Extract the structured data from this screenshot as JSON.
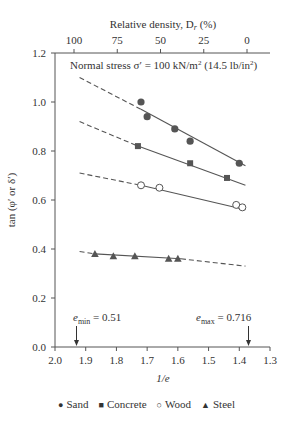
{
  "chart_data": {
    "type": "scatter",
    "title": "",
    "annotation": "Normal stress σ′ = 100 kN/m² (14.5 lb/in²)",
    "xlabel": "1/e",
    "ylabel": "tan (φ′ or δ′)",
    "top_xlabel": "Relative density, Dr (%)",
    "xlim": [
      2.0,
      1.3
    ],
    "ylim": [
      0.0,
      1.2
    ],
    "x_ticks": [
      "2.0",
      "1.9",
      "1.8",
      "1.7",
      "1.6",
      "1.5",
      "1.4",
      "1.3"
    ],
    "y_ticks": [
      "0.0",
      "0.2",
      "0.4",
      "0.6",
      "0.8",
      "1.0",
      "1.2"
    ],
    "top_ticks": [
      "100",
      "75",
      "50",
      "25",
      "0"
    ],
    "grid": false,
    "legend_position": "bottom",
    "markers": [
      {
        "label": "e_min = 0.51",
        "x": 1.93
      },
      {
        "label": "e_max = 0.716",
        "x": 1.37
      }
    ],
    "series": [
      {
        "name": "Sand",
        "marker": "filled-circle",
        "points": [
          [
            1.72,
            1.0
          ],
          [
            1.7,
            0.94
          ],
          [
            1.61,
            0.89
          ],
          [
            1.56,
            0.84
          ],
          [
            1.4,
            0.75
          ]
        ],
        "fit": {
          "dashed_from": [
            1.92,
            1.1
          ],
          "solid_from": [
            1.72,
            0.97
          ],
          "to": [
            1.38,
            0.74
          ]
        }
      },
      {
        "name": "Concrete",
        "marker": "filled-square",
        "points": [
          [
            1.73,
            0.82
          ],
          [
            1.56,
            0.75
          ],
          [
            1.44,
            0.69
          ]
        ],
        "fit": {
          "dashed_from": [
            1.92,
            0.92
          ],
          "solid_from": [
            1.73,
            0.82
          ],
          "to": [
            1.38,
            0.66
          ]
        }
      },
      {
        "name": "Wood",
        "marker": "open-circle",
        "points": [
          [
            1.72,
            0.66
          ],
          [
            1.66,
            0.65
          ],
          [
            1.41,
            0.58
          ],
          [
            1.39,
            0.57
          ]
        ],
        "fit": {
          "dashed_from": [
            1.92,
            0.71
          ],
          "solid_from": [
            1.72,
            0.66
          ],
          "to": [
            1.38,
            0.56
          ]
        }
      },
      {
        "name": "Steel",
        "marker": "filled-triangle",
        "points": [
          [
            1.87,
            0.38
          ],
          [
            1.81,
            0.37
          ],
          [
            1.74,
            0.37
          ],
          [
            1.63,
            0.36
          ],
          [
            1.6,
            0.36
          ]
        ],
        "fit": {
          "dashed_from": [
            1.92,
            0.39
          ],
          "solid_from": [
            1.87,
            0.38
          ],
          "solid_to": [
            1.59,
            0.36
          ],
          "to": [
            1.38,
            0.33
          ]
        }
      }
    ]
  },
  "legend": {
    "items": [
      {
        "symbol": "●",
        "label": "Sand"
      },
      {
        "symbol": "■",
        "label": "Concrete"
      },
      {
        "symbol": "○",
        "label": "Wood"
      },
      {
        "symbol": "▲",
        "label": "Steel"
      }
    ]
  },
  "labels": {
    "top_axis_title": "Relative density, D",
    "top_axis_sub": "r",
    "top_axis_suffix": " (%)",
    "annotation": "Normal stress σ′ = 100 kN/m",
    "annotation_sup": "2",
    "annotation_tail": " (14.5 lb/in",
    "annotation_sup2": "2",
    "annotation_end": ")",
    "emin_e": "e",
    "emin_sub": "min",
    "emin_val": " = 0.51",
    "emax_e": "e",
    "emax_sub": "max",
    "emax_val": " = 0.716",
    "xlabel": "1/e",
    "ylabel": "tan (φ′ or δ′)"
  }
}
